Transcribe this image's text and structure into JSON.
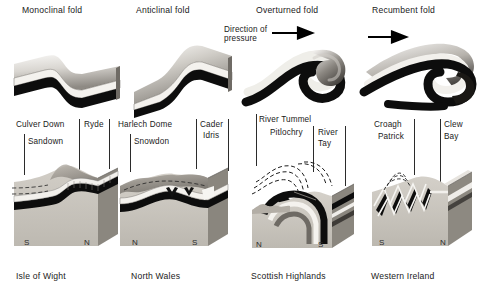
{
  "figure": {
    "kind": "geological-fold-types-diagram",
    "top_row_title_note": "Four fold block models",
    "bottom_row_title_note": "Four regional block diagrams"
  },
  "top_row": {
    "blocks": [
      {
        "title": "Monoclinal fold",
        "fold_type": "monocline"
      },
      {
        "title": "Anticlinal fold",
        "fold_type": "anticline"
      },
      {
        "title": "Overturned fold",
        "fold_type": "overturned"
      },
      {
        "title": "Recumbent fold",
        "fold_type": "recumbent"
      }
    ],
    "pressure_annotation": {
      "line1": "Direction of",
      "line2": "pressure",
      "arrow_icon": "arrow-right-icon"
    },
    "second_arrow_icon": "arrow-right-icon"
  },
  "bottom_row": {
    "panels": [
      {
        "caption": "Isle of Wight",
        "labels": [
          "Culver Down",
          "Sandown",
          "Ryde"
        ],
        "compass_left": "S",
        "compass_right": "N"
      },
      {
        "caption": "North Wales",
        "labels": [
          "Harlech Dome",
          "Snowdon",
          "Cader",
          "Idris"
        ],
        "cader_idris_line1": "Cader",
        "cader_idris_line2": "Idris",
        "compass_left": "N",
        "compass_right": "S"
      },
      {
        "caption": "Scottish Highlands",
        "labels": [
          "River Tummel",
          "Pitlochry",
          "River",
          "Tay"
        ],
        "river_tay_line1": "River",
        "river_tay_line2": "Tay",
        "compass_left": "N",
        "compass_right": "S"
      },
      {
        "caption": "Western Ireland",
        "labels": [
          "Croagh",
          "Patrick",
          "Clew",
          "Bay"
        ],
        "croagh_patrick_line1": "Croagh",
        "croagh_patrick_line2": "Patrick",
        "clew_bay_line1": "Clew",
        "clew_bay_line2": "Bay",
        "compass_left": "S",
        "compass_right": "N"
      }
    ]
  },
  "colors": {
    "ink": "#1a1a1a",
    "dark_bed": "#101010",
    "light_bed": "#f2f0ec",
    "mid_bed": "#9a968f",
    "rock_body": "#c9c5bd",
    "rock_side": "#8e8a83",
    "background": "#ffffff"
  }
}
